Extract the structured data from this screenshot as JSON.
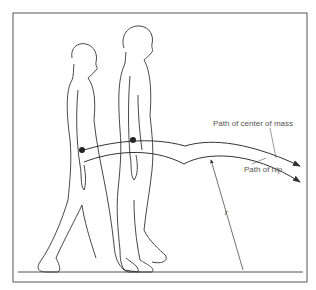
{
  "diagram": {
    "labels": {
      "center_of_mass": "Path of center of mass",
      "hip": "Path of hip",
      "radius": "r"
    },
    "colors": {
      "line": "#333333",
      "text": "#555555",
      "background": "#ffffff"
    }
  }
}
